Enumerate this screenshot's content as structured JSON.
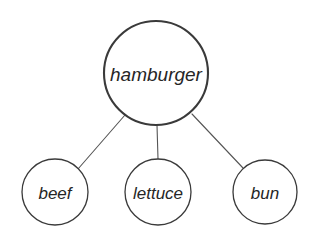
{
  "diagram": {
    "type": "semantic-network",
    "background_color": "#ffffff",
    "stroke_color": "#3a3a3a",
    "edge_color": "#555555",
    "text_color": "#262626",
    "root": {
      "id": "hamburger",
      "label": "hamburger",
      "cx": 156,
      "cy": 73,
      "r": 52,
      "stroke_width": 2.1,
      "font_size": 19
    },
    "children": [
      {
        "id": "beef",
        "label": "beef",
        "cx": 55,
        "cy": 192,
        "r": 33,
        "stroke_width": 1.3,
        "font_size": 17
      },
      {
        "id": "lettuce",
        "label": "lettuce",
        "cx": 158,
        "cy": 192,
        "r": 33,
        "stroke_width": 1.3,
        "font_size": 17
      },
      {
        "id": "bun",
        "label": "bun",
        "cx": 265,
        "cy": 192,
        "r": 32,
        "stroke_width": 1.3,
        "font_size": 17
      }
    ],
    "edges": [
      {
        "id": "hamburger-beef",
        "from": "hamburger",
        "to": "beef",
        "x1": 125,
        "y1": 115,
        "x2": 78,
        "y2": 169,
        "width": 1.1
      },
      {
        "id": "hamburger-lettuce",
        "from": "hamburger",
        "to": "lettuce",
        "x1": 157,
        "y1": 125,
        "x2": 158,
        "y2": 159,
        "width": 1.1
      },
      {
        "id": "hamburger-bun",
        "from": "hamburger",
        "to": "bun",
        "x1": 192,
        "y1": 114,
        "x2": 243,
        "y2": 168,
        "width": 1.1
      }
    ]
  }
}
